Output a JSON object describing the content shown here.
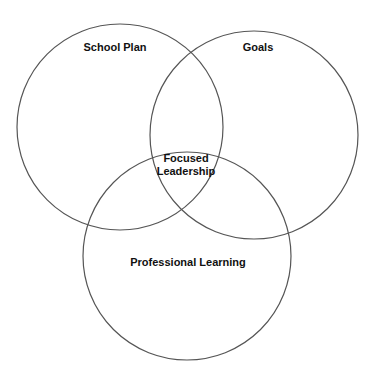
{
  "diagram": {
    "type": "venn",
    "title_partial": "",
    "circles": [
      {
        "id": "school-plan",
        "label": "School Plan",
        "cx": 120,
        "cy": 127,
        "r": 103
      },
      {
        "id": "goals",
        "label": "Goals",
        "cx": 254,
        "cy": 135,
        "r": 104
      },
      {
        "id": "professional-learning",
        "label": "Professional Learning",
        "cx": 187,
        "cy": 256,
        "r": 104
      }
    ],
    "intersection": {
      "label_line1": "Focused",
      "label_line2": "Leadership"
    },
    "stroke_color": "#555555"
  }
}
